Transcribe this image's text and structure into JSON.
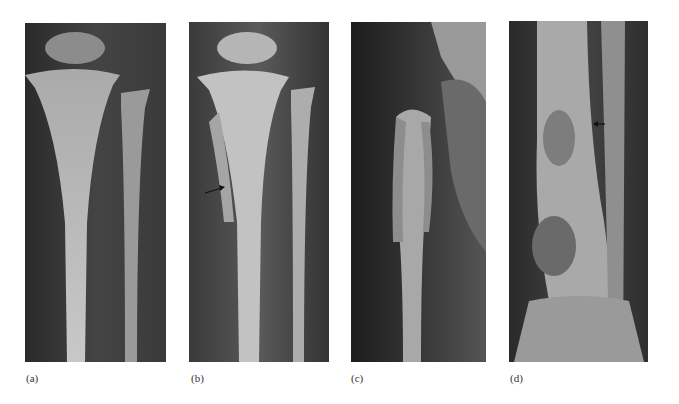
{
  "figure": {
    "panels": [
      {
        "id": "a",
        "label": "(a)",
        "description": "Radiograph of proximal tibia and fibula, normal appearance"
      },
      {
        "id": "b",
        "label": "(b)",
        "description": "Radiograph of proximal tibia and fibula with arrow indicating lesion"
      },
      {
        "id": "c",
        "label": "(c)",
        "description": "Radiograph of proximal humerus with periosteal reaction"
      },
      {
        "id": "d",
        "label": "(d)",
        "description": "Radiograph of distal tibia with lytic lesions and arrow"
      }
    ]
  }
}
